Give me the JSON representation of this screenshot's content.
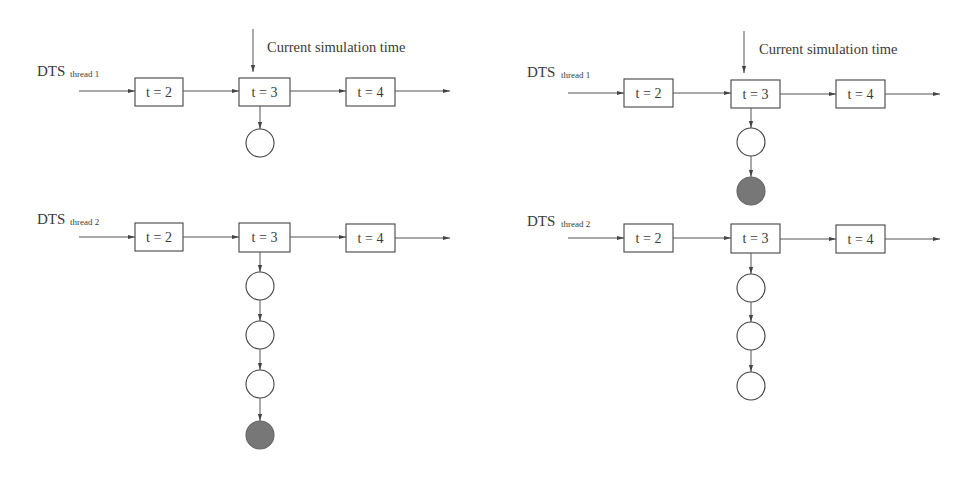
{
  "diagram": {
    "colors": {
      "stroke": "#444444",
      "text": "#3a3a3a",
      "filled_node": "#777777",
      "background": "#ffffff"
    },
    "panels": [
      {
        "id": "left",
        "caption": "Current simulation time",
        "threads": [
          {
            "label": "DTS",
            "subscript": "thread 1",
            "steps": [
              "t = 2",
              "t = 3",
              "t = 4"
            ],
            "queue_at_step": "t = 3",
            "queue": [
              "empty"
            ]
          },
          {
            "label": "DTS",
            "subscript": "thread 2",
            "steps": [
              "t = 2",
              "t = 3",
              "t = 4"
            ],
            "queue_at_step": "t = 3",
            "queue": [
              "empty",
              "empty",
              "empty",
              "filled"
            ]
          }
        ]
      },
      {
        "id": "right",
        "caption": "Current simulation time",
        "threads": [
          {
            "label": "DTS",
            "subscript": "thread 1",
            "steps": [
              "t = 2",
              "t = 3",
              "t = 4"
            ],
            "queue_at_step": "t = 3",
            "queue": [
              "empty",
              "filled"
            ]
          },
          {
            "label": "DTS",
            "subscript": "thread 2",
            "steps": [
              "t = 2",
              "t = 3",
              "t = 4"
            ],
            "queue_at_step": "t = 3",
            "queue": [
              "empty",
              "empty",
              "empty"
            ]
          }
        ]
      }
    ]
  }
}
